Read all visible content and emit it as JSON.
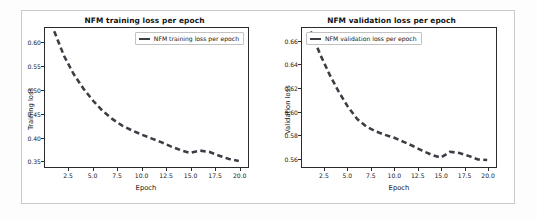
{
  "figure": {
    "background_color": "#ffffff",
    "frame_color": "#c9c9c9",
    "line_color": "#3d3d46"
  },
  "charts": {
    "left": {
      "title": "NFM training loss per epoch",
      "legend_label": "NFM training loss per epoch",
      "legend_position": "upper right",
      "xlabel": "Epoch",
      "ylabel": "Training loss",
      "xticks": [
        "2.5",
        "5.0",
        "7.5",
        "10.0",
        "12.5",
        "15.0",
        "17.5",
        "20.0"
      ],
      "yticks": [
        "0.35",
        "0.40",
        "0.45",
        "0.50",
        "0.55",
        "0.60"
      ]
    },
    "right": {
      "title": "NFM validation loss per epoch",
      "legend_label": "NFM validation loss per epoch",
      "legend_position": "upper left",
      "xlabel": "Epoch",
      "ylabel": "Validation loss",
      "xticks": [
        "2.5",
        "5.0",
        "7.5",
        "10.0",
        "12.5",
        "15.0",
        "17.5",
        "20.0"
      ],
      "yticks": [
        "0.56",
        "0.58",
        "0.60",
        "0.62",
        "0.64",
        "0.66"
      ]
    }
  },
  "chart_data": [
    {
      "type": "line",
      "title": "NFM training loss per epoch",
      "xlabel": "Epoch",
      "ylabel": "Training loss",
      "xlim": [
        0.05,
        20.95
      ],
      "ylim": [
        0.336,
        0.632
      ],
      "xticks": [
        2.5,
        5.0,
        7.5,
        10.0,
        12.5,
        15.0,
        17.5,
        20.0
      ],
      "yticks": [
        0.35,
        0.4,
        0.45,
        0.5,
        0.55,
        0.6
      ],
      "grid": false,
      "legend": [
        "NFM training loss per epoch"
      ],
      "legend_position": "upper right",
      "linestyle": "dashed",
      "color": "#3d3d46",
      "x": [
        1,
        2,
        3,
        4,
        5,
        6,
        7,
        8,
        9,
        10,
        11,
        12,
        13,
        14,
        15,
        16,
        17,
        18,
        19,
        20
      ],
      "series": [
        {
          "name": "NFM training loss per epoch",
          "values": [
            0.625,
            0.573,
            0.534,
            0.503,
            0.477,
            0.455,
            0.438,
            0.424,
            0.414,
            0.405,
            0.397,
            0.389,
            0.38,
            0.372,
            0.366,
            0.371,
            0.368,
            0.36,
            0.353,
            0.349
          ]
        }
      ]
    },
    {
      "type": "line",
      "title": "NFM validation loss per epoch",
      "xlabel": "Epoch",
      "ylabel": "Validation loss",
      "xlim": [
        0.05,
        20.95
      ],
      "ylim": [
        0.5525,
        0.6715
      ],
      "xticks": [
        2.5,
        5.0,
        7.5,
        10.0,
        12.5,
        15.0,
        17.5,
        20.0
      ],
      "yticks": [
        0.56,
        0.58,
        0.6,
        0.62,
        0.64,
        0.66
      ],
      "grid": false,
      "legend": [
        "NFM validation loss per epoch"
      ],
      "legend_position": "upper left",
      "linestyle": "dashed",
      "color": "#3d3d46",
      "x": [
        1,
        2,
        3,
        4,
        5,
        6,
        7,
        8,
        9,
        10,
        11,
        12,
        13,
        14,
        15,
        16,
        17,
        18,
        19,
        20
      ],
      "series": [
        {
          "name": "NFM validation loss per epoch",
          "values": [
            0.6685,
            0.649,
            0.632,
            0.617,
            0.604,
            0.5935,
            0.587,
            0.583,
            0.58,
            0.5775,
            0.574,
            0.5705,
            0.5665,
            0.563,
            0.5605,
            0.5655,
            0.5645,
            0.562,
            0.559,
            0.5585
          ]
        }
      ]
    }
  ]
}
